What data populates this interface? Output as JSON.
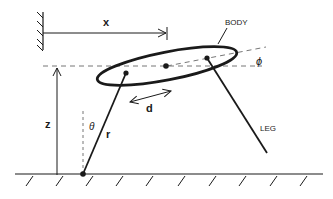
{
  "diagram": {
    "labels": {
      "x": "x",
      "z": "z",
      "body": "BODY",
      "phi": "ϕ",
      "theta": "θ",
      "r": "r",
      "d": "d",
      "leg": "LEG"
    },
    "colors": {
      "stroke": "#1a1a1a",
      "dashed": "#777777",
      "background": "#ffffff"
    }
  }
}
